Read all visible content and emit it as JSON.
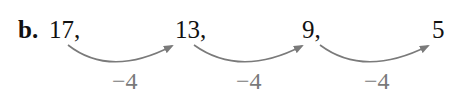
{
  "problem": {
    "label": "b.",
    "terms": [
      "17,",
      "13,",
      "9,",
      "5"
    ],
    "differences": [
      "−4",
      "−4",
      "−4"
    ],
    "arrow_color": "#7a7a7a"
  }
}
